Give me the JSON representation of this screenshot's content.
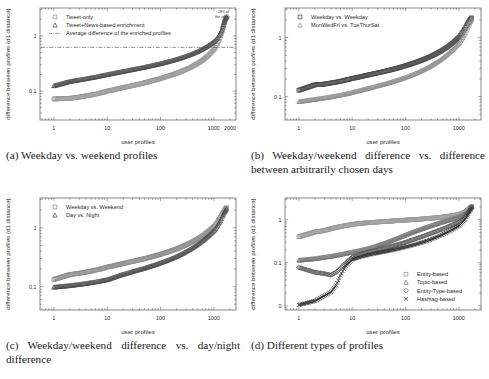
{
  "figure": {
    "name": "profile-difference-figure",
    "panels": [
      "a",
      "b",
      "c",
      "d"
    ]
  },
  "captions": {
    "a": "(a) Weekday vs. weekend profiles",
    "b": "(b) Weekday/weekend difference vs. difference between arbitrarily chosen days",
    "c": "(c) Weekday/weekend difference vs. day/night difference",
    "d": "(d) Different types of profiles"
  },
  "chart_data": [
    {
      "panel": "a",
      "type": "scatter",
      "title": "",
      "xlabel": "user profiles",
      "ylabel": "difference between profiles (d1 distance)",
      "xscale": "log",
      "yscale": "log",
      "xlim": [
        0.55,
        2600
      ],
      "ylim": [
        0.03,
        3.2
      ],
      "xticks": [
        1,
        10,
        100,
        1000,
        2000
      ],
      "xticklabels": [
        "1",
        "10",
        "100",
        "1000",
        "2000"
      ],
      "yticks": [
        0.1,
        1
      ],
      "yticklabels": [
        "0.1",
        "1"
      ],
      "grid": false,
      "legend_position": "top-left",
      "annotations": [
        {
          "text": "~28% of",
          "x": 1450,
          "y": 2.55
        },
        {
          "text": "the users",
          "x": 1450,
          "y": 2.15
        }
      ],
      "hline": {
        "value": 0.62,
        "style": "dash-dot",
        "label": "Average difference of the enriched profiles"
      },
      "series": [
        {
          "name": "Tweet-only",
          "marker": "square",
          "color": "#9a9a9a",
          "x": [
            1,
            2,
            3,
            4,
            5,
            6,
            7,
            8,
            9,
            10,
            13,
            17,
            22,
            28,
            36,
            47,
            60,
            78,
            100,
            130,
            170,
            220,
            285,
            370,
            480,
            620,
            800,
            1030,
            1180,
            1300,
            1400,
            1480,
            1540,
            1600,
            1660,
            1720
          ],
          "y": [
            0.072,
            0.074,
            0.078,
            0.082,
            0.085,
            0.088,
            0.091,
            0.094,
            0.097,
            0.1,
            0.105,
            0.112,
            0.118,
            0.124,
            0.131,
            0.139,
            0.148,
            0.158,
            0.169,
            0.183,
            0.199,
            0.218,
            0.241,
            0.271,
            0.31,
            0.365,
            0.445,
            0.58,
            0.72,
            0.9,
            1.12,
            1.38,
            1.62,
            1.85,
            2.05,
            2.2
          ]
        },
        {
          "name": "Tweet+News-based enrichment",
          "marker": "triangle",
          "color": "#4d4d4d",
          "x": [
            1,
            2,
            3,
            4,
            5,
            6,
            7,
            8,
            9,
            10,
            13,
            17,
            22,
            28,
            36,
            47,
            60,
            78,
            100,
            130,
            170,
            220,
            285,
            370,
            480,
            620,
            800,
            1030,
            1180,
            1300,
            1400,
            1480,
            1540,
            1600,
            1660,
            1720
          ],
          "y": [
            0.125,
            0.15,
            0.16,
            0.168,
            0.175,
            0.18,
            0.186,
            0.191,
            0.196,
            0.2,
            0.21,
            0.221,
            0.232,
            0.243,
            0.255,
            0.268,
            0.282,
            0.298,
            0.315,
            0.336,
            0.36,
            0.388,
            0.421,
            0.462,
            0.514,
            0.582,
            0.672,
            0.8,
            0.93,
            1.08,
            1.27,
            1.5,
            1.72,
            1.92,
            2.08,
            2.22
          ]
        }
      ]
    },
    {
      "panel": "b",
      "type": "scatter",
      "title": "",
      "xlabel": "user profiles",
      "ylabel": "difference between profiles (d1 distance)",
      "xscale": "log",
      "yscale": "log",
      "xlim": [
        0.55,
        2600
      ],
      "ylim": [
        0.04,
        3.2
      ],
      "xticks": [
        1,
        10,
        100,
        1000
      ],
      "xticklabels": [
        "1",
        "10",
        "100",
        "1000"
      ],
      "yticks": [
        0.1,
        1
      ],
      "yticklabels": [
        "0.1",
        "1"
      ],
      "grid": false,
      "legend_position": "top-left",
      "series": [
        {
          "name": "Weekday vs. Weekday",
          "marker": "square",
          "color": "#4d4d4d",
          "x": [
            1,
            2,
            3,
            4,
            5,
            6,
            7,
            8,
            9,
            10,
            13,
            17,
            22,
            28,
            36,
            47,
            60,
            78,
            100,
            130,
            170,
            220,
            285,
            370,
            480,
            620,
            800,
            1030,
            1180,
            1320,
            1450,
            1550,
            1640,
            1720
          ],
          "y": [
            0.128,
            0.158,
            0.163,
            0.17,
            0.176,
            0.182,
            0.188,
            0.193,
            0.198,
            0.203,
            0.213,
            0.225,
            0.237,
            0.249,
            0.262,
            0.277,
            0.293,
            0.312,
            0.334,
            0.36,
            0.391,
            0.428,
            0.473,
            0.53,
            0.605,
            0.705,
            0.845,
            1.04,
            1.24,
            1.48,
            1.72,
            1.92,
            2.06,
            2.18
          ]
        },
        {
          "name": "MonWedFri vs. TueThurSat",
          "marker": "triangle",
          "color": "#8f8f8f",
          "x": [
            1,
            2,
            3,
            4,
            5,
            6,
            7,
            8,
            9,
            10,
            13,
            17,
            22,
            28,
            36,
            47,
            60,
            78,
            100,
            130,
            170,
            220,
            285,
            370,
            480,
            620,
            800,
            1030,
            1180,
            1320,
            1450,
            1550,
            1640,
            1720
          ],
          "y": [
            0.082,
            0.09,
            0.095,
            0.099,
            0.103,
            0.106,
            0.109,
            0.112,
            0.115,
            0.118,
            0.125,
            0.133,
            0.141,
            0.15,
            0.159,
            0.17,
            0.182,
            0.196,
            0.212,
            0.232,
            0.256,
            0.286,
            0.324,
            0.373,
            0.438,
            0.527,
            0.648,
            0.82,
            1.0,
            1.22,
            1.47,
            1.7,
            1.88,
            2.05
          ]
        }
      ]
    },
    {
      "panel": "c",
      "type": "scatter",
      "title": "",
      "xlabel": "user profiles",
      "ylabel": "difference between profiles (d1 distance)",
      "xscale": "log",
      "yscale": "log",
      "xlim": [
        0.55,
        2600
      ],
      "ylim": [
        0.04,
        3.2
      ],
      "xticks": [
        1,
        10,
        100,
        1000
      ],
      "xticklabels": [
        "1",
        "10",
        "100",
        "1000"
      ],
      "yticks": [
        0.1,
        1
      ],
      "yticklabels": [
        "0.1",
        "1"
      ],
      "grid": false,
      "legend_position": "top-left",
      "series": [
        {
          "name": "Weekday vs. Weekend",
          "marker": "square",
          "color": "#8f8f8f",
          "x": [
            1,
            2,
            3,
            4,
            5,
            6,
            7,
            8,
            9,
            10,
            13,
            17,
            22,
            28,
            36,
            47,
            60,
            78,
            100,
            130,
            170,
            220,
            285,
            370,
            480,
            620,
            800,
            1030,
            1180,
            1320,
            1450,
            1550,
            1640,
            1720
          ],
          "y": [
            0.132,
            0.16,
            0.168,
            0.176,
            0.183,
            0.19,
            0.196,
            0.202,
            0.208,
            0.214,
            0.225,
            0.238,
            0.251,
            0.264,
            0.278,
            0.294,
            0.311,
            0.331,
            0.354,
            0.381,
            0.413,
            0.452,
            0.499,
            0.558,
            0.634,
            0.735,
            0.875,
            1.07,
            1.26,
            1.49,
            1.73,
            1.93,
            2.07,
            2.19
          ]
        },
        {
          "name": "Day vs. Night",
          "marker": "triangle",
          "color": "#4d4d4d",
          "x": [
            1,
            2,
            3,
            4,
            5,
            6,
            7,
            8,
            9,
            10,
            13,
            17,
            22,
            28,
            36,
            47,
            60,
            78,
            100,
            130,
            170,
            220,
            285,
            370,
            480,
            620,
            800,
            1030,
            1180,
            1320,
            1450,
            1550,
            1640,
            1720
          ],
          "y": [
            0.098,
            0.104,
            0.109,
            0.113,
            0.117,
            0.12,
            0.123,
            0.126,
            0.129,
            0.131,
            0.142,
            0.155,
            0.166,
            0.177,
            0.189,
            0.202,
            0.217,
            0.234,
            0.253,
            0.276,
            0.304,
            0.338,
            0.381,
            0.436,
            0.508,
            0.605,
            0.735,
            0.91,
            1.09,
            1.31,
            1.56,
            1.78,
            1.95,
            2.1
          ]
        }
      ]
    },
    {
      "panel": "d",
      "type": "scatter",
      "title": "",
      "xlabel": "user profiles",
      "ylabel": "difference between profiles (d1 distance)",
      "xscale": "log",
      "yscale": "log",
      "xlim": [
        0.55,
        2600
      ],
      "ylim": [
        0.008,
        3.2
      ],
      "xticks": [
        1,
        10,
        100,
        1000
      ],
      "xticklabels": [
        "1",
        "10",
        "100",
        "1000"
      ],
      "yticks": [
        0.01,
        0.1,
        1
      ],
      "yticklabels": [
        "0",
        "0.1",
        "1"
      ],
      "grid": false,
      "legend_position": "bottom-right",
      "series": [
        {
          "name": "Entity-based",
          "marker": "square",
          "color": "#9a9a9a",
          "x": [
            1,
            2,
            3,
            4,
            5,
            6,
            7,
            8,
            9,
            10,
            13,
            17,
            22,
            28,
            36,
            47,
            60,
            78,
            100,
            130,
            170,
            220,
            285,
            370,
            480,
            620,
            800,
            1030,
            1180,
            1320,
            1450,
            1550,
            1650,
            1750
          ],
          "y": [
            0.4,
            0.52,
            0.56,
            0.62,
            0.66,
            0.69,
            0.72,
            0.74,
            0.76,
            0.78,
            0.81,
            0.84,
            0.86,
            0.88,
            0.9,
            0.92,
            0.94,
            0.96,
            0.98,
            1.0,
            1.02,
            1.05,
            1.08,
            1.11,
            1.15,
            1.2,
            1.26,
            1.34,
            1.42,
            1.52,
            1.65,
            1.78,
            1.92,
            2.05
          ]
        },
        {
          "name": "Topic-based",
          "marker": "triangle",
          "color": "#777777",
          "x": [
            1,
            2,
            3,
            4,
            5,
            6,
            7,
            8,
            9,
            10,
            13,
            17,
            22,
            28,
            36,
            47,
            60,
            78,
            100,
            130,
            170,
            220,
            285,
            370,
            480,
            620,
            800,
            1030,
            1180,
            1320,
            1450,
            1550,
            1650,
            1750
          ],
          "y": [
            0.115,
            0.125,
            0.135,
            0.142,
            0.15,
            0.156,
            0.162,
            0.168,
            0.173,
            0.178,
            0.19,
            0.205,
            0.222,
            0.245,
            0.272,
            0.305,
            0.345,
            0.392,
            0.445,
            0.505,
            0.57,
            0.64,
            0.715,
            0.795,
            0.88,
            0.97,
            1.06,
            1.17,
            1.27,
            1.4,
            1.56,
            1.72,
            1.88,
            2.02
          ]
        },
        {
          "name": "Entity-Type-based",
          "marker": "diamond",
          "color": "#5a5a5a",
          "x": [
            1,
            2,
            3,
            4,
            5,
            6,
            7,
            8,
            9,
            10,
            13,
            17,
            22,
            28,
            36,
            47,
            60,
            78,
            100,
            130,
            170,
            220,
            285,
            370,
            480,
            620,
            800,
            1030,
            1180,
            1320,
            1450,
            1550,
            1650,
            1750
          ],
          "y": [
            0.078,
            0.06,
            0.056,
            0.052,
            0.06,
            0.075,
            0.09,
            0.105,
            0.12,
            0.135,
            0.152,
            0.168,
            0.182,
            0.195,
            0.21,
            0.228,
            0.248,
            0.272,
            0.3,
            0.335,
            0.375,
            0.42,
            0.472,
            0.532,
            0.6,
            0.682,
            0.78,
            0.9,
            1.02,
            1.18,
            1.38,
            1.58,
            1.78,
            1.96
          ]
        },
        {
          "name": "Hashtag-based",
          "marker": "cross",
          "color": "#303030",
          "x": [
            1,
            2,
            3,
            4,
            5,
            6,
            7,
            8,
            9,
            10,
            13,
            17,
            22,
            28,
            36,
            47,
            60,
            78,
            100,
            130,
            170,
            220,
            285,
            370,
            480,
            620,
            800,
            1030,
            1180,
            1320,
            1450,
            1550,
            1650,
            1750
          ],
          "y": [
            0.0105,
            0.013,
            0.017,
            0.021,
            0.03,
            0.05,
            0.072,
            0.09,
            0.105,
            0.118,
            0.132,
            0.145,
            0.156,
            0.166,
            0.176,
            0.188,
            0.201,
            0.216,
            0.233,
            0.253,
            0.277,
            0.306,
            0.342,
            0.388,
            0.446,
            0.52,
            0.615,
            0.74,
            0.87,
            1.04,
            1.26,
            1.48,
            1.7,
            1.92
          ]
        }
      ]
    }
  ]
}
